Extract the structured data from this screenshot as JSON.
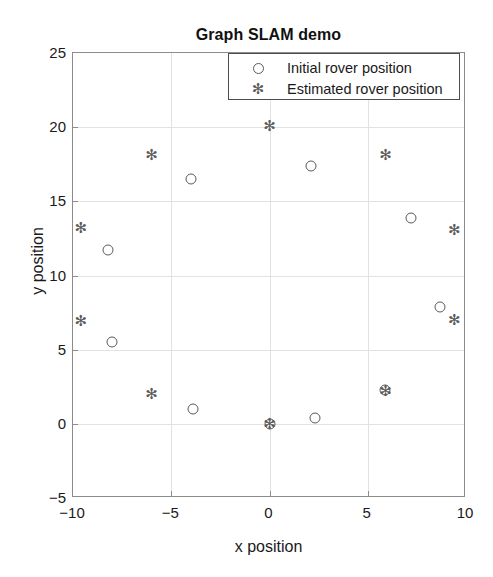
{
  "chart_data": {
    "type": "scatter",
    "title": "Graph SLAM demo",
    "xlabel": "x position",
    "ylabel": "y position",
    "xlim": [
      -10,
      10
    ],
    "ylim": [
      -5,
      25
    ],
    "xticks": [
      -10,
      -5,
      0,
      5,
      10
    ],
    "yticks": [
      -5,
      0,
      5,
      10,
      15,
      20,
      25
    ],
    "xticklabels": [
      "−10",
      "−5",
      "0",
      "5",
      "10"
    ],
    "yticklabels": [
      "−5",
      "0",
      "5",
      "10",
      "15",
      "20",
      "25"
    ],
    "grid": true,
    "legend_position": "upper right",
    "series": [
      {
        "name": "Initial rover position",
        "marker": "circle",
        "color": "#5a5a5a",
        "points": [
          {
            "x": -8.2,
            "y": 11.7
          },
          {
            "x": -8.0,
            "y": 5.5
          },
          {
            "x": -4.0,
            "y": 16.5
          },
          {
            "x": -3.9,
            "y": 1.0
          },
          {
            "x": 0.0,
            "y": 0.0
          },
          {
            "x": 2.1,
            "y": 17.4
          },
          {
            "x": 2.3,
            "y": 0.4
          },
          {
            "x": 5.9,
            "y": 2.3
          },
          {
            "x": 7.2,
            "y": 13.9
          },
          {
            "x": 8.7,
            "y": 7.9
          }
        ]
      },
      {
        "name": "Estimated rover position",
        "marker": "asterisk",
        "color": "#5a5a5a",
        "points": [
          {
            "x": -9.6,
            "y": 13.2
          },
          {
            "x": -9.6,
            "y": 6.9
          },
          {
            "x": -6.0,
            "y": 18.1
          },
          {
            "x": -6.0,
            "y": 2.0
          },
          {
            "x": 0.0,
            "y": 20.1
          },
          {
            "x": 0.0,
            "y": 0.0
          },
          {
            "x": 5.9,
            "y": 18.1
          },
          {
            "x": 5.9,
            "y": 2.2
          },
          {
            "x": 9.4,
            "y": 13.1
          },
          {
            "x": 9.4,
            "y": 7.0
          }
        ]
      }
    ]
  },
  "legend": {
    "entries": [
      {
        "label": "Initial rover position",
        "marker": "circle"
      },
      {
        "label": "Estimated rover position",
        "marker": "asterisk"
      }
    ]
  }
}
